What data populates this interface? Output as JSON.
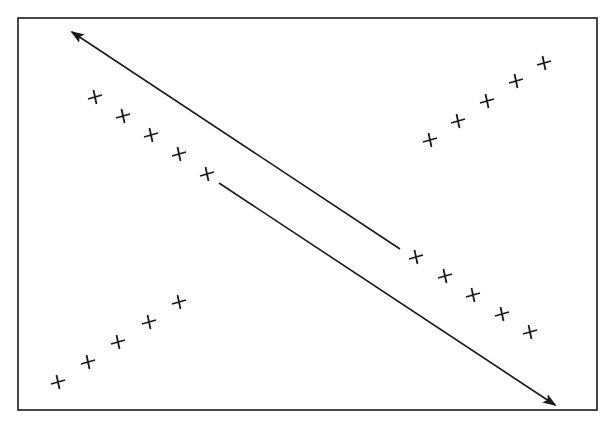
{
  "figure": {
    "colors": {
      "ink": "#1a1a1a",
      "background": "#ffffff"
    },
    "frame": {
      "x1": 18,
      "y1": 18,
      "x2": 597,
      "y2": 410
    },
    "arrows": [
      {
        "name": "upper-arrow-pointing-up-left",
        "from": [
          400,
          249
        ],
        "to": [
          72,
          32
        ],
        "head_at": "to"
      },
      {
        "name": "lower-arrow-pointing-down-right",
        "from": [
          219,
          183
        ],
        "to": [
          555,
          405
        ],
        "head_at": "to"
      }
    ],
    "cross_groups": [
      {
        "name": "upper-left-row",
        "points": [
          [
            95,
            97
          ],
          [
            123,
            116
          ],
          [
            151,
            135
          ],
          [
            179,
            154
          ],
          [
            207,
            174
          ]
        ]
      },
      {
        "name": "upper-right-row",
        "points": [
          [
            430,
            140
          ],
          [
            458,
            121
          ],
          [
            487,
            101
          ],
          [
            516,
            81
          ],
          [
            544,
            63
          ]
        ]
      },
      {
        "name": "lower-left-row",
        "points": [
          [
            58,
            382
          ],
          [
            88,
            362
          ],
          [
            118,
            342
          ],
          [
            149,
            322
          ],
          [
            179,
            302
          ]
        ]
      },
      {
        "name": "lower-right-row",
        "points": [
          [
            416,
            257
          ],
          [
            445,
            276
          ],
          [
            473,
            295
          ],
          [
            502,
            314
          ],
          [
            530,
            332
          ]
        ]
      }
    ],
    "cross_size": 7
  }
}
